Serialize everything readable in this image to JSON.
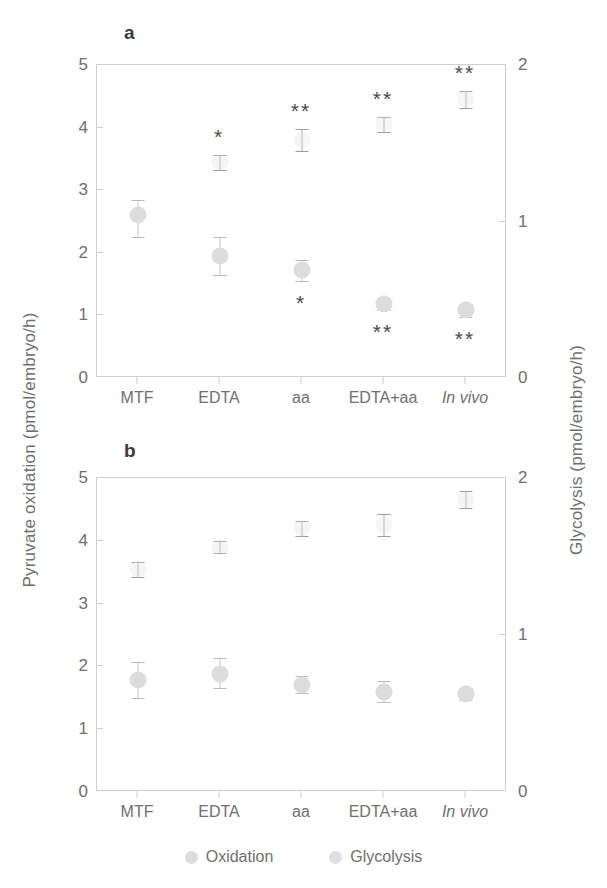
{
  "figure": {
    "left_axis_title": "Pyruvate oxidation (pmol/embryo/h)",
    "right_axis_title": "Glycolysis (pmol/embryo/h)"
  },
  "legend": {
    "items": [
      {
        "label": "Oxidation",
        "color": "#dcdcdc",
        "marker": "filled-circle"
      },
      {
        "label": "Glycolysis",
        "color": "#e0e0e0",
        "marker": "filled-circle"
      }
    ]
  },
  "chart_data": [
    {
      "type": "scatter",
      "panel": "a",
      "title": "a",
      "xlabel": "",
      "ylabel": "Pyruvate oxidation (pmol/embryo/h)",
      "y2label": "Glycolysis (pmol/embryo/h)",
      "categories": [
        "MTF",
        "EDTA",
        "aa",
        "EDTA+aa",
        "In vivo"
      ],
      "categories_italic": [
        false,
        false,
        false,
        false,
        true
      ],
      "ylim": [
        0,
        5
      ],
      "yticks": [
        0,
        1,
        2,
        3,
        4,
        5
      ],
      "y2lim": [
        0,
        2
      ],
      "y2ticks": [
        0,
        1,
        2
      ],
      "grid": false,
      "legend_position": "bottom",
      "series": [
        {
          "name": "Oxidation",
          "axis": "left",
          "values": [
            2.6,
            1.95,
            1.72,
            1.18,
            1.08
          ],
          "err_low": [
            0.35,
            0.3,
            0.17,
            0.1,
            0.1
          ],
          "err_high": [
            0.25,
            0.3,
            0.17,
            0.1,
            0.1
          ],
          "significance": [
            "",
            "",
            "*",
            "**",
            "**"
          ],
          "significance_side": [
            "",
            "",
            "below",
            "below",
            "below"
          ]
        },
        {
          "name": "Glycolysis",
          "axis": "right",
          "values": [
            null,
            1.38,
            1.52,
            1.62,
            1.78
          ],
          "values_left_scale": [
            null,
            3.45,
            3.8,
            4.05,
            4.45
          ],
          "err_low": [
            null,
            0.12,
            0.18,
            0.12,
            0.13
          ],
          "err_high": [
            null,
            0.12,
            0.18,
            0.12,
            0.13
          ],
          "significance": [
            "",
            "*",
            "**",
            "**",
            "**"
          ],
          "significance_side": [
            "",
            "above",
            "above",
            "above",
            "above"
          ]
        }
      ]
    },
    {
      "type": "scatter",
      "panel": "b",
      "title": "b",
      "xlabel": "",
      "ylabel": "Pyruvate oxidation (pmol/embryo/h)",
      "y2label": "Glycolysis (pmol/embryo/h)",
      "categories": [
        "MTF",
        "EDTA",
        "aa",
        "EDTA+aa",
        "In vivo"
      ],
      "categories_italic": [
        false,
        false,
        false,
        false,
        true
      ],
      "ylim": [
        0,
        5
      ],
      "yticks": [
        0,
        1,
        2,
        3,
        4,
        5
      ],
      "y2lim": [
        0,
        2
      ],
      "y2ticks": [
        0,
        1,
        2
      ],
      "grid": false,
      "legend_position": "bottom",
      "series": [
        {
          "name": "Oxidation",
          "axis": "left",
          "values": [
            1.79,
            1.88,
            1.71,
            1.6,
            1.56
          ],
          "err_low": [
            0.3,
            0.23,
            0.14,
            0.17,
            0.1
          ],
          "err_high": [
            0.28,
            0.25,
            0.13,
            0.16,
            0.1
          ],
          "significance": [
            "",
            "",
            "",
            "",
            ""
          ],
          "significance_side": [
            "",
            "",
            "",
            "",
            ""
          ]
        },
        {
          "name": "Glycolysis",
          "axis": "right",
          "values": [
            1.42,
            1.56,
            1.68,
            1.7,
            1.86
          ],
          "values_left_scale": [
            3.55,
            3.9,
            4.2,
            4.25,
            4.65
          ],
          "err_low": [
            0.12,
            0.1,
            0.12,
            0.18,
            0.12
          ],
          "err_high": [
            0.12,
            0.1,
            0.12,
            0.18,
            0.14
          ],
          "significance": [
            "",
            "",
            "",
            "",
            ""
          ],
          "significance_side": [
            "",
            "",
            "",
            "",
            ""
          ]
        }
      ]
    }
  ]
}
